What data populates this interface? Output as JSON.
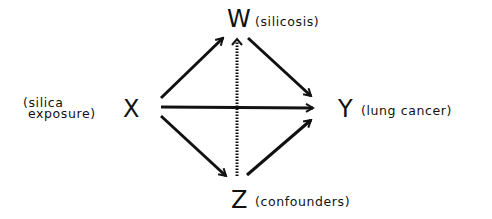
{
  "diagram": {
    "type": "causal-dag",
    "nodes": {
      "x": {
        "letter": "X",
        "description_line1": "(silica",
        "description_line2": "exposure)"
      },
      "w": {
        "letter": "W",
        "description": "(silicosis)"
      },
      "y": {
        "letter": "Y",
        "description": "(lung cancer)"
      },
      "z": {
        "letter": "Z",
        "description": "(confounders)"
      }
    },
    "edges": [
      {
        "from": "X",
        "to": "W",
        "style": "solid"
      },
      {
        "from": "X",
        "to": "Y",
        "style": "solid"
      },
      {
        "from": "X",
        "to": "Z",
        "style": "solid"
      },
      {
        "from": "W",
        "to": "Y",
        "style": "solid"
      },
      {
        "from": "Z",
        "to": "Y",
        "style": "solid"
      },
      {
        "from": "Z",
        "to": "W",
        "style": "dotted"
      }
    ],
    "colors": {
      "stroke": "#111111",
      "background": "#ffffff"
    }
  }
}
